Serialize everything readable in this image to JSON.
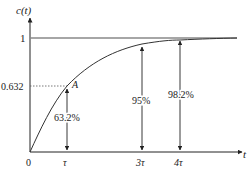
{
  "diagram": {
    "y_axis_label": "c(t)",
    "x_axis_label": "t",
    "y_tick_one": "1",
    "y_tick_0632": "0.632",
    "origin_label": "0",
    "point_label": "A",
    "x_ticks": [
      "τ",
      "3τ",
      "4τ"
    ],
    "percent_labels": [
      "63.2%",
      "95%",
      "98.2%"
    ],
    "colors": {
      "line": "#333333",
      "asymptote": "#888888",
      "dotted": "#555555"
    }
  }
}
